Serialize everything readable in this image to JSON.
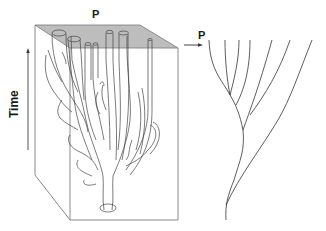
{
  "diagram": {
    "labels": {
      "top_plane": "P",
      "tree_plane": "P",
      "time_axis": "Time"
    },
    "colors": {
      "plane_fill": "#bdbdbd",
      "line": "#444444",
      "box_line": "#8a8a8a",
      "background": "#ffffff"
    },
    "components": [
      {
        "id": "time-arrow",
        "description": "Vertical arrow pointing upward labeled Time"
      },
      {
        "id": "block",
        "description": "3D transparent box containing a branching coral-like tube structure"
      },
      {
        "id": "top-plane",
        "description": "Gray shaded top surface labeled P with tube cross-sections"
      },
      {
        "id": "arrow-to-tree",
        "description": "Horizontal arrow from plane P to tree"
      },
      {
        "id": "tree",
        "description": "Branching lineage tree with 7 tips at the plane P"
      }
    ],
    "tree_tip_count": 7
  }
}
